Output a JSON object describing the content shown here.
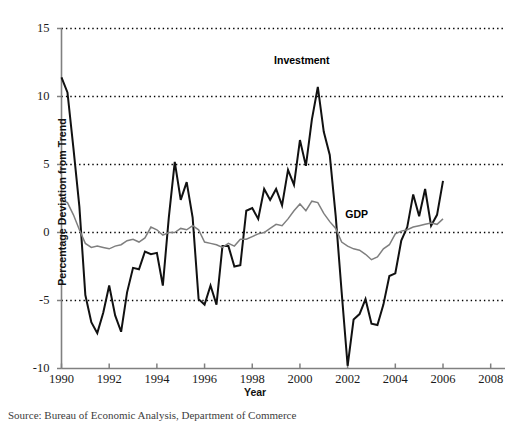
{
  "figure": {
    "background": "#ffffff",
    "investment_color": "#111111",
    "gdp_color": "#7f7f7f",
    "grid_color": "#000000",
    "axis_color": "#808080"
  },
  "labels": {
    "ylabel": "Percentage Deviation from Trend",
    "xlabel": "Year",
    "investment": "Investment",
    "gdp": "GDP",
    "caption": "Source: Bureau of Economic Analysis, Department of Commerce"
  },
  "chart_data": {
    "type": "line",
    "title": "",
    "xlabel": "Year",
    "ylabel": "Percentage Deviation from Trend",
    "xlim": [
      1990,
      2008.6
    ],
    "ylim": [
      -10,
      15
    ],
    "xticks": [
      1990,
      1992,
      1994,
      1996,
      1998,
      2000,
      2002,
      2004,
      2006,
      2008
    ],
    "yticks": [
      -10,
      -5,
      0,
      5,
      10,
      15
    ],
    "xtick_labels": [
      "1990",
      "1992",
      "1994",
      "1996",
      "1998",
      "2000",
      "2002",
      "2004",
      "2006",
      "2008"
    ],
    "ytick_labels": [
      "-10",
      "-5",
      "0",
      "5",
      "10",
      "15"
    ],
    "grid": "horizontal-dotted",
    "legend": "inline-annotations",
    "annotations": [
      {
        "text": "Investment",
        "x": 2000.3,
        "y": 12.6
      },
      {
        "text": "GDP",
        "x": 2001.9,
        "y": 1.3
      }
    ],
    "x": [
      1990.0,
      1990.25,
      1990.5,
      1990.75,
      1991.0,
      1991.25,
      1991.5,
      1991.75,
      1992.0,
      1992.25,
      1992.5,
      1992.75,
      1993.0,
      1993.25,
      1993.5,
      1993.75,
      1994.0,
      1994.25,
      1994.5,
      1994.75,
      1995.0,
      1995.25,
      1995.5,
      1995.75,
      1996.0,
      1996.25,
      1996.5,
      1996.75,
      1997.0,
      1997.25,
      1997.5,
      1997.75,
      1998.0,
      1998.25,
      1998.5,
      1998.75,
      1999.0,
      1999.25,
      1999.5,
      1999.75,
      2000.0,
      2000.25,
      2000.5,
      2000.75,
      2001.0,
      2001.25,
      2001.5,
      2001.75,
      2002.0,
      2002.25,
      2002.5,
      2002.75,
      2003.0,
      2003.25,
      2003.5,
      2003.75,
      2004.0,
      2004.25,
      2004.5,
      2004.75,
      2005.0,
      2005.25,
      2005.5,
      2005.75,
      2006.0
    ],
    "series": [
      {
        "name": "Investment",
        "color": "#111111",
        "width": 2.0,
        "values": [
          11.4,
          10.3,
          6.2,
          1.9,
          -4.6,
          -6.6,
          -7.4,
          -5.9,
          -3.9,
          -6.1,
          -7.3,
          -4.4,
          -2.6,
          -2.7,
          -1.4,
          -1.6,
          -1.5,
          -3.9,
          1.1,
          5.2,
          2.4,
          3.7,
          1.1,
          -4.9,
          -5.3,
          -3.9,
          -5.3,
          -1.0,
          -1.0,
          -2.5,
          -2.4,
          1.6,
          1.8,
          1.0,
          3.2,
          2.4,
          3.2,
          2.0,
          4.6,
          3.5,
          6.8,
          4.9,
          8.3,
          10.7,
          7.4,
          5.7,
          1.2,
          -4.4,
          -9.8,
          -6.4,
          -6.0,
          -4.9,
          -6.7,
          -6.8,
          -5.3,
          -3.2,
          -3.0,
          -0.6,
          0.4,
          2.8,
          1.2,
          3.2,
          0.5,
          1.3,
          3.8
        ]
      },
      {
        "name": "GDP",
        "color": "#7f7f7f",
        "width": 1.5,
        "values": [
          2.4,
          2.2,
          1.3,
          0.2,
          -0.8,
          -1.1,
          -1.0,
          -1.1,
          -1.2,
          -1.0,
          -0.9,
          -0.6,
          -0.5,
          -0.7,
          -0.4,
          0.4,
          0.2,
          -0.2,
          0.0,
          0.0,
          0.3,
          0.2,
          0.5,
          0.2,
          -0.7,
          -0.8,
          -0.9,
          -1.1,
          -0.8,
          -1.0,
          -0.5,
          -0.5,
          -0.3,
          -0.1,
          0.0,
          0.3,
          0.6,
          0.5,
          1.0,
          1.6,
          2.1,
          1.6,
          2.3,
          2.2,
          1.4,
          0.8,
          0.3,
          -0.7,
          -1.0,
          -1.2,
          -1.3,
          -1.6,
          -2.0,
          -1.8,
          -1.2,
          -0.9,
          -0.1,
          0.1,
          0.2,
          0.4,
          0.5,
          0.6,
          0.7,
          0.6,
          1.0
        ]
      }
    ]
  }
}
